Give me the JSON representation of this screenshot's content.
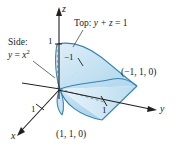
{
  "figure": {
    "background_color": "#ffffff",
    "surface_fill_color": "#b9dcef",
    "surface_fill_color_light": "#d7ebf7",
    "surface_edge_color": "#2e86b8",
    "axis_color": "#231f20",
    "text_color": "#1a1a1a",
    "axes": [
      {
        "name": "z",
        "label": "z",
        "direction": "up"
      },
      {
        "name": "y",
        "label": "y",
        "direction": "right"
      },
      {
        "name": "x",
        "label": "x",
        "direction": "down-left"
      }
    ],
    "tick_labels": [
      {
        "name": "z-tick-1",
        "label": "1",
        "axis": "z"
      },
      {
        "name": "x-tick-1",
        "label": "1",
        "axis": "x"
      },
      {
        "name": "y-tick-1",
        "label": "1",
        "axis": "y"
      },
      {
        "name": "tick-neg-1",
        "label": "−1",
        "axis": "x-negative"
      }
    ],
    "annotations": [
      {
        "name": "top-surface-label",
        "prefix": "Top:",
        "equation_lhs": "y + z",
        "equation_rhs": "1",
        "full": "Top:  y + z = 1"
      },
      {
        "name": "side-surface-label",
        "prefix": "Side:",
        "equation_lhs": "y",
        "equation_rhs": "x",
        "exponent": "2",
        "full": "Side:  y = x²"
      }
    ],
    "points": [
      {
        "name": "point-neg-one-one-zero",
        "label": "(−1, 1, 0)"
      },
      {
        "name": "point-one-one-zero",
        "label": "(1, 1, 0)"
      }
    ]
  }
}
